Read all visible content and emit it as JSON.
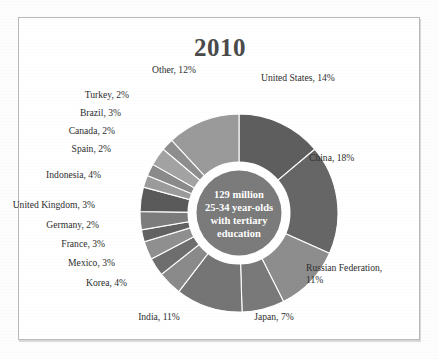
{
  "chart_data": {
    "type": "pie",
    "title": "2010",
    "subtitle": "",
    "xlabel": "",
    "ylabel": "",
    "donut": true,
    "legend_position": "callout-labels",
    "grid": false,
    "center_label_lines": [
      "129 million",
      "25-34 year-olds",
      "with tertiary",
      "education"
    ],
    "units": "percent of total",
    "start_angle_deg": 0,
    "direction": "clockwise",
    "categories": [
      "United States",
      "China",
      "Russian Federation",
      "Japan",
      "India",
      "Korea",
      "Mexico",
      "France",
      "Germany",
      "United Kingdom",
      "Indonesia",
      "Spain",
      "Canada",
      "Brazil",
      "Turkey",
      "Other"
    ],
    "values": [
      14,
      18,
      11,
      7,
      11,
      4,
      3,
      3,
      2,
      3,
      4,
      2,
      2,
      3,
      2,
      12
    ],
    "slices": [
      {
        "label": "United States, 14%",
        "name": "United States",
        "value": 14,
        "color": "#5e5e5e"
      },
      {
        "label": "China, 18%",
        "name": "China",
        "value": 18,
        "color": "#666666"
      },
      {
        "label": "Russian Federation, 11%",
        "name": "Russian Federation",
        "value": 11,
        "color": "#8d8d8d"
      },
      {
        "label": "Japan, 7%",
        "name": "Japan",
        "value": 7,
        "color": "#797979"
      },
      {
        "label": "India, 11%",
        "name": "India",
        "value": 11,
        "color": "#757575"
      },
      {
        "label": "Korea, 4%",
        "name": "Korea",
        "value": 4,
        "color": "#8a8a8a"
      },
      {
        "label": "Mexico, 3%",
        "name": "Mexico",
        "value": 3,
        "color": "#6e6e6e"
      },
      {
        "label": "France, 3%",
        "name": "France",
        "value": 3,
        "color": "#8f8f8f"
      },
      {
        "label": "Germany, 2%",
        "name": "Germany",
        "value": 2,
        "color": "#626262"
      },
      {
        "label": "United Kingdom, 3%",
        "name": "United Kingdom",
        "value": 3,
        "color": "#7c7c7c"
      },
      {
        "label": "Indonesia, 4%",
        "name": "Indonesia",
        "value": 4,
        "color": "#5a5a5a"
      },
      {
        "label": "Spain, 2%",
        "name": "Spain",
        "value": 2,
        "color": "#9b9b9b"
      },
      {
        "label": "Canada, 2%",
        "name": "Canada",
        "value": 2,
        "color": "#8a8a8a"
      },
      {
        "label": "Brazil, 3%",
        "name": "Brazil",
        "value": 3,
        "color": "#a3a3a3"
      },
      {
        "label": "Turkey, 2%",
        "name": "Turkey",
        "value": 2,
        "color": "#8e8e8e"
      },
      {
        "label": "Other, 12%",
        "name": "Other",
        "value": 12,
        "color": "#9a9a9a"
      }
    ]
  },
  "labels": {
    "united_states": "United States, 14%",
    "china": "China, 18%",
    "russian_federation": "Russian Federation, 11%",
    "japan": "Japan, 7%",
    "india": "India, 11%",
    "korea": "Korea, 4%",
    "mexico": "Mexico, 3%",
    "france": "France, 3%",
    "germany": "Germany, 2%",
    "united_kingdom": "United Kingdom, 3%",
    "indonesia": "Indonesia, 4%",
    "spain": "Spain, 2%",
    "canada": "Canada, 2%",
    "brazil": "Brazil, 3%",
    "turkey": "Turkey, 2%",
    "other": "Other, 12%"
  },
  "center": {
    "line1": "129 million",
    "line2": "25-34 year-olds",
    "line3": "with tertiary",
    "line4": "education"
  },
  "colors": {
    "title": "#4a4a4a",
    "label": "#2e2e2e",
    "frame": "#b9b9b9",
    "center_text": "#ffffff",
    "donut_gap": "#ffffff"
  }
}
